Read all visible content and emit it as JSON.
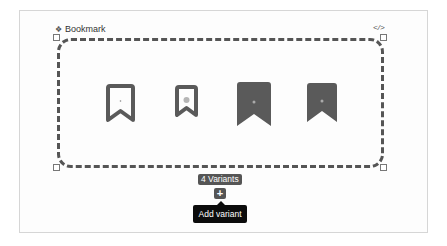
{
  "component_set": {
    "name": "Bookmark",
    "set_icon": "component-set-icon",
    "code_icon": "</>"
  },
  "variants": [
    {
      "name": "outline-large",
      "style": "outline",
      "icon": "bookmark-outline-icon"
    },
    {
      "name": "outline-small",
      "style": "outline",
      "icon": "bookmark-outline-icon"
    },
    {
      "name": "filled-large",
      "style": "filled",
      "icon": "bookmark-filled-icon"
    },
    {
      "name": "filled-small",
      "style": "filled",
      "icon": "bookmark-filled-icon"
    }
  ],
  "variants_badge": "4 Variants",
  "add_button": {
    "label": "+",
    "tooltip": "Add variant"
  },
  "colors": {
    "icon": "#5a5a5a",
    "tooltip_bg": "#0c0c0c",
    "badge_bg": "#555555"
  }
}
